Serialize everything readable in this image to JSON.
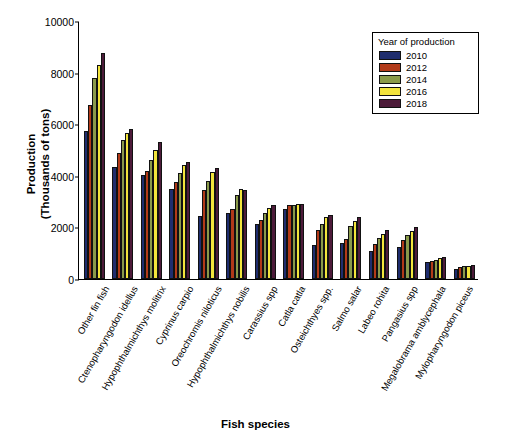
{
  "chart_data": {
    "type": "bar",
    "title": "",
    "xlabel": "Fish species",
    "ylabel": "Production\n(Thousands of tons)",
    "ylabel_line1": "Production",
    "ylabel_line2": "(Thousands of tons)",
    "ylim": [
      0,
      10000
    ],
    "yticks": [
      0,
      2000,
      4000,
      6000,
      8000,
      10000
    ],
    "grid": false,
    "legend": {
      "title": "Year of production",
      "position": "top-right",
      "entries": [
        {
          "name": "2010",
          "color": "#1f2d6e"
        },
        {
          "name": "2012",
          "color": "#b23a19"
        },
        {
          "name": "2014",
          "color": "#8a9a4a"
        },
        {
          "name": "2016",
          "color": "#f2e43c"
        },
        {
          "name": "2018",
          "color": "#4d1b3a"
        }
      ]
    },
    "categories": [
      "Other fin fish",
      "Ctenopharyngodon idellus",
      "Hypophthalmichthys molitrix",
      "Cyprinus carpio",
      "Oreochromis niloticus",
      "Hypophthalmichthys nobilis",
      "Carassius spp",
      "Catla catla",
      "Osteichthyes spp.",
      "Salmo salar",
      "Labeo rohita",
      "Pangasius spp",
      "Megalobrama amblycephala",
      "Mylopharyngodon piceus"
    ],
    "series": [
      {
        "name": "2010",
        "color": "#1f2d6e",
        "values": [
          5750,
          4350,
          4050,
          3500,
          2450,
          2550,
          2150,
          2700,
          1300,
          1400,
          1100,
          1250,
          650,
          400
        ]
      },
      {
        "name": "2012",
        "color": "#b23a19",
        "values": [
          6750,
          4900,
          4200,
          3750,
          3450,
          2700,
          2300,
          2850,
          1900,
          1550,
          1350,
          1500,
          700,
          450
        ]
      },
      {
        "name": "2014",
        "color": "#8a9a4a",
        "values": [
          7800,
          5400,
          4600,
          4100,
          3800,
          3250,
          2550,
          2850,
          2150,
          2050,
          1600,
          1700,
          750,
          500
        ]
      },
      {
        "name": "2016",
        "color": "#f2e43c",
        "values": [
          8300,
          5650,
          5000,
          4400,
          4150,
          3500,
          2750,
          2900,
          2400,
          2250,
          1750,
          1850,
          800,
          520
        ]
      },
      {
        "name": "2018",
        "color": "#4d1b3a",
        "values": [
          8750,
          5800,
          5300,
          4550,
          4300,
          3450,
          2850,
          2900,
          2500,
          2400,
          1900,
          2000,
          850,
          550
        ]
      }
    ]
  }
}
